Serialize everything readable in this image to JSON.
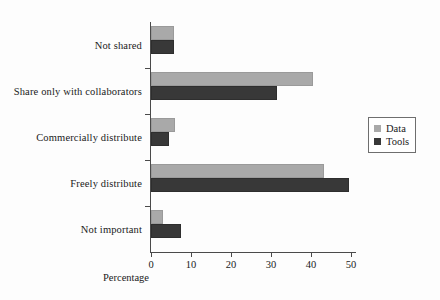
{
  "chart_data": {
    "type": "bar",
    "orientation": "horizontal",
    "title": "",
    "xlabel": "Percentage",
    "ylabel": "",
    "xlim": [
      0,
      51
    ],
    "grid": false,
    "legend_position": "right",
    "categories": [
      "Not shared",
      "Share only with collaborators",
      "Commercially distribute",
      "Freely distribute",
      "Not important"
    ],
    "series": [
      {
        "name": "Data",
        "color": "#a9a9a9",
        "values": [
          5.8,
          40.5,
          5.9,
          43.2,
          3.0
        ]
      },
      {
        "name": "Tools",
        "color": "#383838",
        "values": [
          5.8,
          31.5,
          4.4,
          49.6,
          7.4
        ]
      }
    ],
    "xticks": [
      0,
      10,
      20,
      30,
      40,
      50
    ],
    "xtick_labels": [
      "0",
      "10",
      "20",
      "30",
      "40",
      "50"
    ]
  },
  "legend": {
    "entries": [
      {
        "label": "Data"
      },
      {
        "label": "Tools"
      }
    ]
  },
  "colors": {
    "data": "#a9a9a9",
    "tools": "#383838",
    "axis": "#4a4a4a",
    "background": "#fdfdfd"
  }
}
